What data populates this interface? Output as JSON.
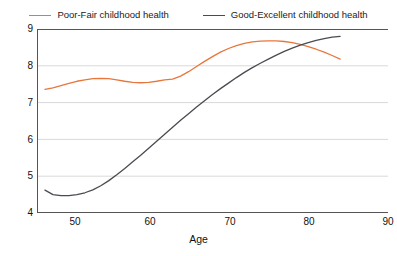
{
  "chart_data": {
    "type": "line",
    "title": "",
    "xlabel": "Age",
    "ylabel": "",
    "xlim": [
      46,
      90
    ],
    "ylim": [
      4,
      9
    ],
    "xticks": [
      50,
      60,
      70,
      80,
      90
    ],
    "yticks": [
      4,
      5,
      6,
      7,
      8,
      9
    ],
    "grid": "horizontal",
    "legend_position": "top-center",
    "colors": {
      "poor_fair": "#E8763C",
      "good_excellent": "#4A4A52",
      "gridline": "#d9d9d9",
      "axis": "#555555",
      "background": "#ffffff"
    },
    "series": [
      {
        "name": "Poor-Fair childhood health",
        "color": "#E8763C",
        "x": [
          47,
          48,
          49,
          50,
          51,
          52,
          53,
          54,
          55,
          56,
          57,
          58,
          59,
          60,
          61,
          62,
          63,
          64,
          65,
          66,
          67,
          68,
          69,
          70,
          71,
          72,
          73,
          74,
          75,
          76,
          77,
          78,
          79,
          80,
          81,
          82,
          83,
          84
        ],
        "y": [
          7.36,
          7.4,
          7.46,
          7.52,
          7.58,
          7.62,
          7.65,
          7.66,
          7.65,
          7.62,
          7.58,
          7.55,
          7.54,
          7.55,
          7.58,
          7.62,
          7.64,
          7.72,
          7.84,
          7.98,
          8.12,
          8.25,
          8.37,
          8.47,
          8.55,
          8.61,
          8.65,
          8.67,
          8.68,
          8.68,
          8.66,
          8.63,
          8.58,
          8.52,
          8.45,
          8.37,
          8.28,
          8.18
        ]
      },
      {
        "name": "Good-Excellent childhood health",
        "color": "#4A4A52",
        "x": [
          47,
          48,
          49,
          50,
          51,
          52,
          53,
          54,
          55,
          56,
          57,
          58,
          59,
          60,
          61,
          62,
          63,
          64,
          65,
          66,
          67,
          68,
          69,
          70,
          71,
          72,
          73,
          74,
          75,
          76,
          77,
          78,
          79,
          80,
          81,
          82,
          83,
          84
        ],
        "y": [
          4.62,
          4.5,
          4.47,
          4.47,
          4.5,
          4.55,
          4.63,
          4.74,
          4.88,
          5.04,
          5.21,
          5.39,
          5.57,
          5.76,
          5.95,
          6.14,
          6.33,
          6.52,
          6.7,
          6.88,
          7.05,
          7.22,
          7.38,
          7.53,
          7.68,
          7.82,
          7.95,
          8.07,
          8.18,
          8.29,
          8.39,
          8.48,
          8.56,
          8.63,
          8.69,
          8.74,
          8.78,
          8.8
        ]
      }
    ]
  },
  "legend": {
    "items": [
      {
        "label": "Poor-Fair childhood health",
        "color": "#E8763C"
      },
      {
        "label": "Good-Excellent childhood health",
        "color": "#4A4A52"
      }
    ]
  },
  "axes": {
    "x": {
      "title": "Age",
      "ticks": [
        "50",
        "60",
        "70",
        "80",
        "90"
      ]
    },
    "y": {
      "title": "",
      "ticks": [
        "9",
        "8",
        "7",
        "6",
        "5",
        "4"
      ]
    }
  }
}
